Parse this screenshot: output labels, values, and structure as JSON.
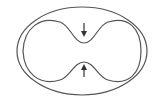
{
  "diagram": {
    "stroke_color": "#555555",
    "background": "#ffffff",
    "outer_ellipse": {
      "cx": 82,
      "cy": 51,
      "rx": 65,
      "ry": 44
    },
    "arrows": [
      {
        "name": "down-arrow",
        "direction": "down",
        "x": 84,
        "y1": 23,
        "y2": 35
      },
      {
        "name": "up-arrow",
        "direction": "up",
        "x": 84,
        "y1": 77,
        "y2": 66
      }
    ]
  }
}
